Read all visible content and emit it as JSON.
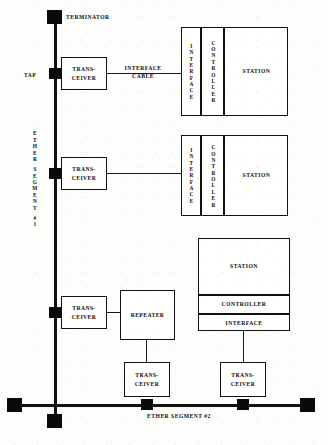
{
  "diagram": {
    "ink_color": "#111111",
    "paper_color": "#fdfdfc"
  },
  "labels": {
    "terminator": "TERMINATOR",
    "tap": "TAP",
    "interface_cable": "INTERFACE\nCABLE",
    "segment1_chars": [
      "E",
      "T",
      "H",
      "E",
      "R",
      "",
      "S",
      "E",
      "G",
      "M",
      "E",
      "N",
      "T",
      "",
      "#",
      "1"
    ],
    "segment2": "ETHER SEGMENT #2"
  },
  "transceivers": [
    {
      "id": "tx-top",
      "label": "TRANS-\nCEIVER"
    },
    {
      "id": "tx-middle",
      "label": "TRANS-\nCEIVER"
    },
    {
      "id": "tx-repeater-up",
      "label": "TRANS-\nCEIVER"
    },
    {
      "id": "tx-repeater-down",
      "label": "TRANS-\nCEIVER"
    },
    {
      "id": "tx-station3",
      "label": "TRANS-\nCEIVER"
    }
  ],
  "repeater": {
    "label": "REPEATER"
  },
  "stations": [
    {
      "id": "station-1",
      "orientation": "vertical-columns",
      "interface_chars": [
        "I",
        "N",
        "T",
        "E",
        "R",
        "F",
        "A",
        "C",
        "E"
      ],
      "controller_chars": [
        "C",
        "O",
        "N",
        "T",
        "R",
        "O",
        "L",
        "L",
        "E",
        "R"
      ],
      "station_label": "STATION"
    },
    {
      "id": "station-2",
      "orientation": "vertical-columns",
      "interface_chars": [
        "I",
        "N",
        "T",
        "E",
        "R",
        "F",
        "A",
        "C",
        "E"
      ],
      "controller_chars": [
        "C",
        "O",
        "N",
        "T",
        "R",
        "O",
        "L",
        "L",
        "E",
        "R"
      ],
      "station_label": "STATION"
    },
    {
      "id": "station-3",
      "orientation": "horizontal-stack",
      "station_label": "STATION",
      "controller_label": "CONTROLLER",
      "interface_label": "INTERFACE"
    }
  ]
}
